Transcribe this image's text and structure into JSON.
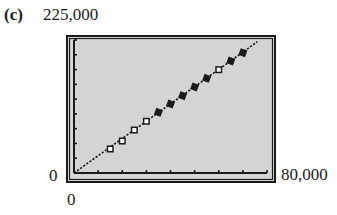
{
  "panel_label": "(c)",
  "axes": {
    "y_max_label": "225,000",
    "y_min_label": "0",
    "x_max_label": "80,000",
    "x_min_label": "0"
  },
  "colors": {
    "background": "#d4d4d4",
    "frame": "#1a1a1a",
    "line": "#1a1a1a",
    "marker": "#1a1a1a"
  },
  "chart_data": {
    "type": "scatter",
    "title": "",
    "panel": "(c)",
    "xlabel": "",
    "ylabel": "",
    "xlim": [
      0,
      80000
    ],
    "ylim": [
      0,
      225000
    ],
    "x_tick_step": 10000,
    "y_tick_step": 25000,
    "grid": false,
    "legend": null,
    "series": [
      {
        "name": "data points",
        "kind": "scatter",
        "points": [
          {
            "x": 15000,
            "y": 40600,
            "marker": "open-square"
          },
          {
            "x": 20000,
            "y": 54100,
            "marker": "open-square"
          },
          {
            "x": 25000,
            "y": 72700,
            "marker": "open-square"
          },
          {
            "x": 30000,
            "y": 87500,
            "marker": "open-square"
          },
          {
            "x": 35000,
            "y": 102700,
            "marker": "filled-square"
          },
          {
            "x": 40000,
            "y": 116700,
            "marker": "filled-square"
          },
          {
            "x": 45000,
            "y": 130800,
            "marker": "filled-square"
          },
          {
            "x": 50000,
            "y": 145500,
            "marker": "filled-square"
          },
          {
            "x": 55000,
            "y": 160200,
            "marker": "filled-square"
          },
          {
            "x": 60000,
            "y": 174800,
            "marker": "open-square"
          },
          {
            "x": 65000,
            "y": 189500,
            "marker": "filled-square"
          },
          {
            "x": 70000,
            "y": 203500,
            "marker": "filled-square"
          }
        ]
      },
      {
        "name": "regression line",
        "kind": "line",
        "style": "dotted",
        "x": [
          0,
          76000
        ],
        "y": [
          0,
          222000
        ]
      }
    ]
  }
}
